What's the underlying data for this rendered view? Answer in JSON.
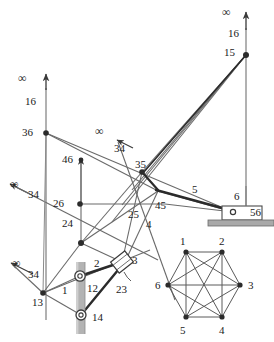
{
  "figure": {
    "type": "kinematic-linkage-diagram",
    "stroke_color": "#4a4a4a",
    "thick_stroke_color": "#2a2a2a",
    "shaft_color": "#9a9a9a",
    "ground_hatch_color": "#8d8d8d",
    "background": "#ffffff"
  },
  "labels": {
    "infinity_top_left": "∞",
    "sixteen_left": "16",
    "thirtysix": "36",
    "fortysix": "46",
    "infinity_upper_mid": "∞",
    "thirtyfour_upper_mid": "34",
    "thirtyfive": "35",
    "infinity_mid_left": "∞",
    "thirtyfour_mid_left": "34",
    "twentysix": "26",
    "twentyfour": "24",
    "twentyfive": "25",
    "fortyfive": "45",
    "four": "4",
    "five": "5",
    "infinity_low_left": "∞",
    "thirtyfour_low_left": "34",
    "thirteen": "13",
    "one": "1",
    "two": "2",
    "twelve": "12",
    "three": "3",
    "twentythree": "23",
    "fourteen": "14",
    "infinity_top_right": "∞",
    "sixteen_right": "16",
    "fifteen": "15",
    "six": "6",
    "fiftysix": "56"
  },
  "graph": {
    "name": "K6-complete-graph-hexagon",
    "vertices": [
      {
        "id": "1",
        "label": "1",
        "x": 186,
        "y": 252
      },
      {
        "id": "2",
        "label": "2",
        "x": 222,
        "y": 252
      },
      {
        "id": "3",
        "label": "3",
        "x": 240,
        "y": 285
      },
      {
        "id": "4",
        "label": "4",
        "x": 222,
        "y": 317
      },
      {
        "id": "5",
        "label": "5",
        "x": 186,
        "y": 317
      },
      {
        "id": "6",
        "label": "6",
        "x": 168,
        "y": 285
      }
    ],
    "edges": [
      [
        "1",
        "2"
      ],
      [
        "1",
        "3"
      ],
      [
        "1",
        "4"
      ],
      [
        "1",
        "5"
      ],
      [
        "1",
        "6"
      ],
      [
        "2",
        "3"
      ],
      [
        "2",
        "4"
      ],
      [
        "2",
        "5"
      ],
      [
        "2",
        "6"
      ],
      [
        "3",
        "4"
      ],
      [
        "3",
        "5"
      ],
      [
        "3",
        "6"
      ],
      [
        "4",
        "5"
      ],
      [
        "4",
        "6"
      ],
      [
        "5",
        "6"
      ]
    ],
    "vertex_label_positions": [
      {
        "label": "1",
        "x": 180,
        "y": 236
      },
      {
        "label": "2",
        "x": 219,
        "y": 236
      },
      {
        "label": "3",
        "x": 248,
        "y": 280
      },
      {
        "label": "4",
        "x": 219,
        "y": 325
      },
      {
        "label": "5",
        "x": 180,
        "y": 325
      },
      {
        "label": "6",
        "x": 155,
        "y": 280
      }
    ]
  },
  "nodes": {
    "n36": {
      "x": 46,
      "y": 133
    },
    "n46": {
      "x": 81,
      "y": 160
    },
    "n35": {
      "x": 142,
      "y": 172
    },
    "n26": {
      "x": 80,
      "y": 204
    },
    "n45": {
      "x": 158,
      "y": 191
    },
    "n24": {
      "x": 81,
      "y": 243
    },
    "n13": {
      "x": 43,
      "y": 293
    },
    "n12": {
      "x": 80,
      "y": 276
    },
    "n14": {
      "x": 81,
      "y": 315
    },
    "n23": {
      "x": 122,
      "y": 262
    },
    "n15": {
      "x": 246,
      "y": 55
    },
    "n56": {
      "x": 233,
      "y": 212
    }
  }
}
